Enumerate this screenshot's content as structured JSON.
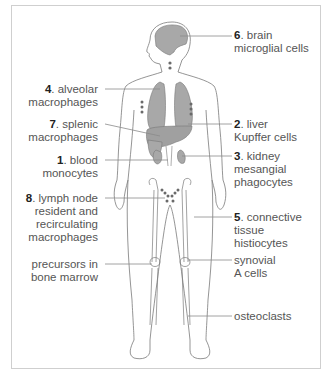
{
  "diagram": {
    "type": "anatomical-figure",
    "colors": {
      "organ_fill": "#a8a8a8",
      "outline": "#707070",
      "leader_line": "#8a8a8a",
      "frame": "#cfcfcf",
      "dots": "#6a6a6a"
    }
  },
  "labels": {
    "brain": {
      "num": "6",
      "line1": ". brain",
      "line2": "microglial cells"
    },
    "alveolar": {
      "num": "4",
      "line1": ". alveolar",
      "line2": "macrophages"
    },
    "liver": {
      "num": "2",
      "line1": ". liver",
      "line2": "Kupffer cells"
    },
    "splenic": {
      "num": "7",
      "line1": ". splenic",
      "line2": "macrophages"
    },
    "kidney": {
      "num": "3",
      "line1": ". kidney",
      "line2": "mesangial",
      "line3": "phagocytes"
    },
    "blood": {
      "num": "1",
      "line1": ". blood",
      "line2": "monocytes"
    },
    "lymph": {
      "num": "8",
      "line1": ". lymph node",
      "line2": "resident and",
      "line3": "recirculating",
      "line4": "macrophages"
    },
    "connective": {
      "num": "5",
      "line1": ". connective",
      "line2": "tissue",
      "line3": "histiocytes"
    },
    "marrow": {
      "line1": "precursors in",
      "line2": "bone marrow"
    },
    "synovial": {
      "line1": "synovial",
      "line2": "A cells"
    },
    "osteo": {
      "line1": "osteoclasts"
    }
  }
}
